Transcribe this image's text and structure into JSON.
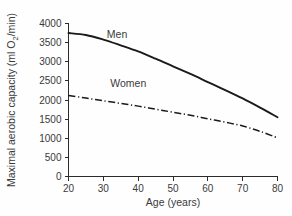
{
  "chart_data": {
    "type": "line",
    "title": "",
    "xlabel": "Age (years)",
    "ylabel_full": "Maximal aerobic capacity (ml O2/min)",
    "ylabel_prefix": "Maximal aerobic capacity (ml O",
    "ylabel_sub": "2",
    "ylabel_suffix": "/min)",
    "xlim": [
      20,
      80
    ],
    "ylim": [
      0,
      4000
    ],
    "xticks": [
      20,
      30,
      40,
      50,
      60,
      70,
      80
    ],
    "yticks": [
      0,
      500,
      1000,
      1500,
      2000,
      2500,
      3000,
      3500,
      4000
    ],
    "xticklabels": [
      "20",
      "30",
      "40",
      "50",
      "60",
      "70",
      "80"
    ],
    "yticklabels": [
      "0",
      "500",
      "1000",
      "1500",
      "2000",
      "2500",
      "3000",
      "3500",
      "4000"
    ],
    "grid": false,
    "legend_position": "inline-annotation",
    "x": [
      20,
      25,
      30,
      35,
      40,
      45,
      50,
      55,
      60,
      65,
      70,
      75,
      80
    ],
    "series": [
      {
        "name": "Men",
        "style": "solid",
        "color": "#1a1a1a",
        "label_x": 31,
        "label_y": 3620,
        "values": [
          3750,
          3700,
          3580,
          3430,
          3270,
          3080,
          2880,
          2680,
          2470,
          2260,
          2040,
          1800,
          1550
        ]
      },
      {
        "name": "Women",
        "style": "dash-dot",
        "color": "#1a1a1a",
        "label_x": 32,
        "label_y": 2330,
        "values": [
          2120,
          2050,
          1980,
          1910,
          1840,
          1760,
          1680,
          1600,
          1510,
          1420,
          1320,
          1180,
          1010
        ]
      }
    ]
  },
  "colors": {
    "background": "#fefefe",
    "axis": "#2b2b2b",
    "text": "#3a3a3a",
    "line": "#1a1a1a"
  }
}
